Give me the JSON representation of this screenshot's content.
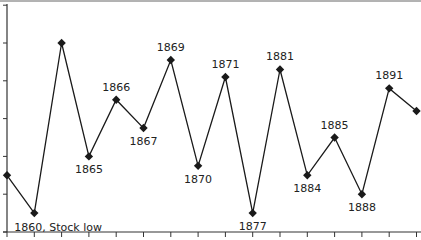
{
  "chart_data": {
    "type": "line",
    "title": "",
    "xlabel": "",
    "ylabel": "",
    "grid": false,
    "legend": null,
    "ylim": [
      0,
      6
    ],
    "y_ticks": [
      0,
      1,
      2,
      3,
      4,
      5,
      6
    ],
    "y_tick_labels_visible": false,
    "x_tick_count": 16,
    "points": [
      {
        "label": "",
        "value": 1.5
      },
      {
        "label": "1860, Stock low",
        "value": 0.5
      },
      {
        "label": "",
        "value": 5.0
      },
      {
        "label": "1865",
        "value": 2.0
      },
      {
        "label": "1866",
        "value": 3.5
      },
      {
        "label": "1867",
        "value": 2.75
      },
      {
        "label": "1869",
        "value": 4.55
      },
      {
        "label": "1870",
        "value": 1.75
      },
      {
        "label": "1871",
        "value": 4.1
      },
      {
        "label": "1877",
        "value": 0.5
      },
      {
        "label": "1881",
        "value": 4.3
      },
      {
        "label": "1884",
        "value": 1.5
      },
      {
        "label": "1885",
        "value": 2.5
      },
      {
        "label": "1888",
        "value": 1.0
      },
      {
        "label": "1891",
        "value": 3.8
      },
      {
        "label": "",
        "value": 3.2
      }
    ],
    "label_positions": [
      "none",
      "below",
      "none",
      "below",
      "above",
      "below",
      "above",
      "below",
      "above",
      "below",
      "above",
      "below",
      "above",
      "below",
      "above",
      "none"
    ],
    "colors": {
      "line": "#1a1a1a",
      "marker": "#1a1a1a",
      "axis": "#333333",
      "text": "#222222"
    }
  }
}
